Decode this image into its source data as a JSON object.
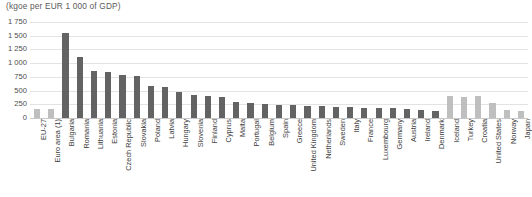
{
  "chart_data": {
    "type": "bar",
    "title": "(kgoe per EUR 1 000 of GDP)",
    "xlabel": "",
    "ylabel": "",
    "ylim": [
      0,
      1750
    ],
    "yticks": [
      "0",
      "250",
      "500",
      "750",
      "1 000",
      "1 250",
      "1 500",
      "1 750"
    ],
    "grid": true,
    "legend": "none",
    "categories": [
      "EU-27",
      "Euro area (1)",
      "Bulgaria",
      "Romania",
      "Lithuania",
      "Estonia",
      "Czech Republic",
      "Slovakia",
      "Poland",
      "Latvia",
      "Hungary",
      "Slovenia",
      "Finland",
      "Cyprus",
      "Malta",
      "Portugal",
      "Belgium",
      "Spain",
      "Greece",
      "United Kingdom",
      "Netherlands",
      "Sweden",
      "Italy",
      "France",
      "Luxembourg",
      "Germany",
      "Austria",
      "Ireland",
      "Denmark",
      "Iceland",
      "Turkey",
      "Croatia",
      "United States",
      "Norway",
      "Japan"
    ],
    "values": [
      167,
      162,
      1545,
      1120,
      855,
      840,
      790,
      765,
      580,
      570,
      480,
      415,
      400,
      375,
      285,
      270,
      260,
      245,
      235,
      225,
      215,
      205,
      195,
      190,
      185,
      180,
      165,
      155,
      135,
      410,
      390,
      400,
      270,
      140,
      120
    ],
    "series_colors": {
      "aggregate": "#bfbfbf",
      "eu_member": "#636363",
      "non_eu": "#bfbfbf"
    },
    "groups": [
      "aggregate",
      "aggregate",
      "eu_member",
      "eu_member",
      "eu_member",
      "eu_member",
      "eu_member",
      "eu_member",
      "eu_member",
      "eu_member",
      "eu_member",
      "eu_member",
      "eu_member",
      "eu_member",
      "eu_member",
      "eu_member",
      "eu_member",
      "eu_member",
      "eu_member",
      "eu_member",
      "eu_member",
      "eu_member",
      "eu_member",
      "eu_member",
      "eu_member",
      "eu_member",
      "eu_member",
      "eu_member",
      "eu_member",
      "non_eu",
      "non_eu",
      "non_eu",
      "non_eu",
      "non_eu",
      "non_eu"
    ]
  }
}
